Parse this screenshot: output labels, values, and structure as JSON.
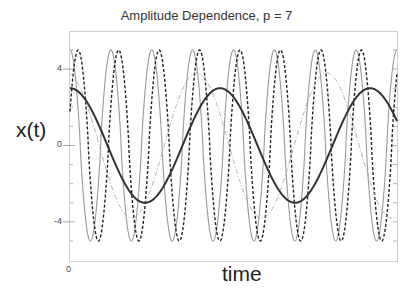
{
  "chart_data": {
    "type": "line",
    "title": "Amplitude Dependence, p = 7",
    "xlabel": "time",
    "ylabel": "x(t)",
    "x_tick_labels": [
      "0"
    ],
    "y_tick_labels": [
      "4",
      "0",
      "-4"
    ],
    "ylim": [
      -6.1,
      6.0
    ],
    "xlim": [
      0,
      8
    ],
    "grid": false,
    "legend": null,
    "series": [
      {
        "name": "amplitude 5 (gray solid)",
        "style": "solid",
        "color": "#9a9a9a",
        "width": 1.1,
        "amplitude": 5,
        "period": 1.0,
        "phase": 0.0
      },
      {
        "name": "amplitude 5 (black dashed)",
        "style": "dashed",
        "color": "#222222",
        "width": 1.4,
        "amplitude": 5,
        "period": 0.99,
        "phase": 0.2
      },
      {
        "name": "amplitude 3.8 (gray dash-dot)",
        "style": "dashdot",
        "color": "#a8a8a8",
        "width": 1.0,
        "amplitude": 3.8,
        "period": 3.18,
        "phase": 3.1
      },
      {
        "name": "amplitude 3 (black thick)",
        "style": "solid",
        "color": "#333333",
        "width": 2.0,
        "amplitude": 3,
        "period": 3.67,
        "phase": 0.0
      }
    ],
    "sample_points": {
      "t": [
        0,
        1,
        2,
        3,
        4,
        5,
        6,
        7,
        8
      ],
      "black_thick": [
        3.0,
        -0.44,
        -2.87,
        1.24,
        2.35,
        -2.11,
        -1.51,
        2.72,
        0.54
      ],
      "gray_dashdot": [
        -3.63,
        -0.75,
        3.32,
        3.77,
        1.61,
        -3.11,
        -3.38,
        0.16,
        3.64
      ]
    }
  },
  "axes": {
    "y_ticks": [
      {
        "label": "4",
        "value": 4
      },
      {
        "label": "0",
        "value": 0
      },
      {
        "label": "-4",
        "value": -4
      }
    ],
    "x_origin_label": "0"
  }
}
